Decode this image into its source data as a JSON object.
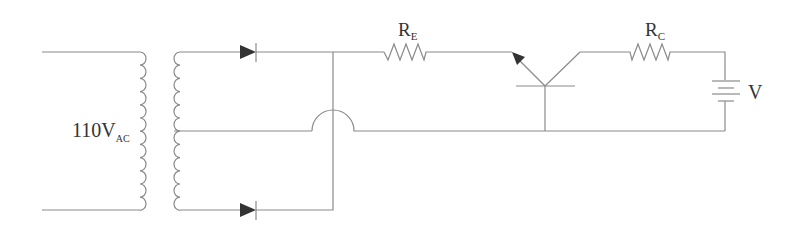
{
  "diagram": {
    "type": "circuit-schematic",
    "labels": {
      "source_main": "110V",
      "source_sub": "AC",
      "re_main": "R",
      "re_sub": "E",
      "rc_main": "R",
      "rc_sub": "C",
      "battery": "V"
    },
    "components": [
      {
        "id": "transformer",
        "kind": "center-tapped transformer",
        "label": "110V AC"
      },
      {
        "id": "diode-top",
        "kind": "diode"
      },
      {
        "id": "diode-bottom",
        "kind": "diode"
      },
      {
        "id": "resistor-e",
        "kind": "resistor",
        "label": "RE"
      },
      {
        "id": "transistor",
        "kind": "transistor (emitter/collector/base)"
      },
      {
        "id": "resistor-c",
        "kind": "resistor",
        "label": "RC"
      },
      {
        "id": "battery",
        "kind": "battery",
        "label": "V"
      }
    ],
    "colors": {
      "wire": "#8a8a8a",
      "fill": "#333333",
      "background": "#ffffff"
    }
  }
}
